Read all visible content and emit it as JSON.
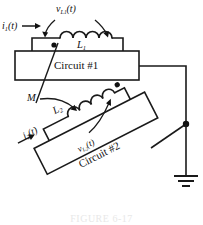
{
  "figure": {
    "caption": "FIGURE 6-17",
    "background_color": "#ffffff",
    "line_color": "#1a1a1a",
    "text_color": "#111111"
  },
  "labels": {
    "v_L1": {
      "base": "v",
      "sub": "L",
      "subsub": "1",
      "arg": "(t)"
    },
    "i_1": {
      "base": "i",
      "sub": "1",
      "arg": "(t)"
    },
    "L_1": {
      "base": "L",
      "sub": "1"
    },
    "M": {
      "base": "M"
    },
    "L_2": {
      "base": "L",
      "sub": "2"
    },
    "i_2": {
      "base": "i",
      "sub": "2",
      "arg": "(t)"
    },
    "v_L2": {
      "base": "v",
      "sub": "L",
      "subsub": "2",
      "arg": "(t)"
    },
    "circuit_1": "Circuit #1",
    "circuit_2": "Circuit #2"
  },
  "components": {
    "inductor_1": {
      "name": "L1",
      "turns": 4,
      "dot_position": "left"
    },
    "inductor_2": {
      "name": "L2",
      "turns": 4,
      "dot_position": "right"
    },
    "mutual_inductance": {
      "name": "M"
    },
    "ground": {
      "name": "earth-ground",
      "bars": 3
    },
    "junction_dot": {
      "count": 1
    }
  }
}
